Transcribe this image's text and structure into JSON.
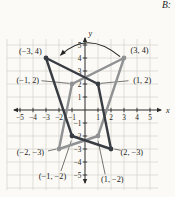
{
  "page_label": "B:",
  "chart_data": {
    "type": "line",
    "title": "",
    "xlabel": "x",
    "ylabel": "y",
    "xlim": [
      -5,
      5
    ],
    "ylim": [
      -5,
      5
    ],
    "grid": true,
    "legend": "none",
    "x_ticks": [
      -5,
      -4,
      -3,
      -2,
      -1,
      1,
      2,
      3,
      4,
      5
    ],
    "y_ticks": [
      5,
      4,
      3,
      2,
      1,
      -1,
      -2,
      -3,
      -4,
      -5
    ],
    "series": [
      {
        "name": "gray-quadrilateral",
        "color": "#8f9193",
        "closed": true,
        "points": [
          [
            3,
            4
          ],
          [
            -1,
            2
          ],
          [
            -2,
            -3
          ],
          [
            1,
            -2
          ]
        ]
      },
      {
        "name": "dark-quadrilateral",
        "color": "#383c43",
        "closed": true,
        "points": [
          [
            -3,
            4
          ],
          [
            1,
            2
          ],
          [
            2,
            -3
          ],
          [
            -1,
            -2
          ]
        ]
      }
    ],
    "point_labels": [
      {
        "text": "(−3, 4)",
        "point": [
          -3,
          4
        ],
        "label_pos": [
          -4.2,
          4.5
        ],
        "leader": null
      },
      {
        "text": "(3, 4)",
        "point": [
          3,
          4
        ],
        "label_pos": [
          4.2,
          4.6
        ],
        "leader": null
      },
      {
        "text": "(−1, 2)",
        "point": [
          -1,
          2
        ],
        "label_pos": [
          -4.4,
          2.3
        ],
        "leader": [
          [
            -3.35,
            2.25
          ],
          [
            -1.2,
            2.05
          ]
        ]
      },
      {
        "text": "(1, 2)",
        "point": [
          1,
          2
        ],
        "label_pos": [
          4.4,
          2.3
        ],
        "leader": [
          [
            3.35,
            2.25
          ],
          [
            1.2,
            2.05
          ]
        ]
      },
      {
        "text": "(−2, −3)",
        "point": [
          -2,
          -3
        ],
        "label_pos": [
          -4.2,
          -3.2
        ],
        "leader": [
          [
            -2.85,
            -3.15
          ],
          [
            -2.2,
            -3.0
          ]
        ]
      },
      {
        "text": "(2, −3)",
        "point": [
          2,
          -3
        ],
        "label_pos": [
          3.6,
          -3.2
        ],
        "leader": [
          [
            2.75,
            -3.1
          ],
          [
            2.25,
            -3.0
          ]
        ]
      },
      {
        "text": "(−1, −2)",
        "point": [
          -1,
          -2
        ],
        "label_pos": [
          -2.5,
          -5.1
        ],
        "leader": [
          [
            -1.85,
            -4.7
          ],
          [
            -1.05,
            -2.35
          ]
        ]
      },
      {
        "text": "(1, −2)",
        "point": [
          1,
          -2
        ],
        "label_pos": [
          2.1,
          -5.35
        ],
        "leader": [
          [
            1.55,
            -4.95
          ],
          [
            1.0,
            -2.35
          ]
        ]
      }
    ],
    "reflection_arrow": {
      "from": [
        2.7,
        4.1
      ],
      "ctrl": [
        0.2,
        6.2
      ],
      "to": [
        -1.9,
        4.2
      ]
    },
    "colors": {
      "axis": "#2b2b2b",
      "grid": "#ccccc6",
      "label": "#1d1d1d",
      "leader": "#4a4a4a",
      "background": "#fbfaf6"
    }
  }
}
